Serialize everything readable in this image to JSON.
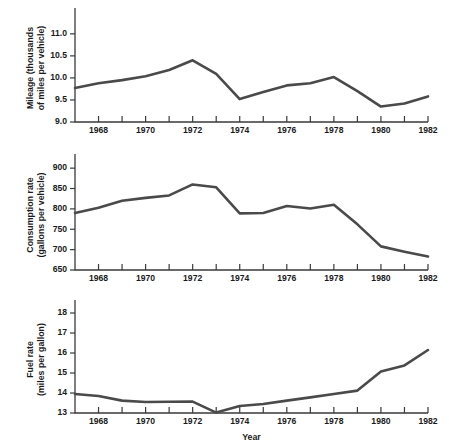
{
  "figure": {
    "xlabel": "Year",
    "line_color": "#4a4a4a",
    "axis_color": "#3a3a3a",
    "background": "#ffffff"
  },
  "chart_data": [
    {
      "type": "line",
      "title": "",
      "panel_index": 0,
      "ylabel": "Mileage (thousands of miles per vehicle)",
      "ylabel_line1": "Mileage (thousands",
      "ylabel_line2": "of miles per vehicle)",
      "xlabel": "",
      "grid": false,
      "legend": "none",
      "x": [
        1967,
        1968,
        1969,
        1970,
        1971,
        1972,
        1973,
        1974,
        1975,
        1976,
        1977,
        1978,
        1979,
        1980,
        1981,
        1982
      ],
      "values": [
        9.77,
        9.88,
        9.95,
        10.04,
        10.18,
        10.4,
        10.09,
        9.52,
        9.68,
        9.83,
        9.88,
        10.02,
        9.7,
        9.35,
        9.42,
        9.58
      ],
      "xlim": [
        1967,
        1982
      ],
      "ylim": [
        9.0,
        11.45
      ],
      "yticks": [
        9.0,
        9.5,
        10.0,
        10.5,
        11.0
      ],
      "ytick_labels": [
        "9.0",
        "9.5",
        "10.0",
        "10.5",
        "11.0"
      ],
      "xticks": [
        1967,
        1968,
        1969,
        1970,
        1971,
        1972,
        1973,
        1974,
        1975,
        1976,
        1977,
        1978,
        1979,
        1980,
        1981,
        1982
      ],
      "xtick_labels": [
        "",
        "1968",
        "",
        "1970",
        "",
        "1972",
        "",
        "1974",
        "",
        "1976",
        "",
        "1978",
        "",
        "1980",
        "",
        "1982"
      ]
    },
    {
      "type": "line",
      "title": "",
      "panel_index": 1,
      "ylabel": "Consumption rate (gallons per vehicle)",
      "ylabel_line1": "Consumption rate",
      "ylabel_line2": "(gallons per vehicle)",
      "xlabel": "",
      "grid": false,
      "legend": "none",
      "x": [
        1967,
        1968,
        1969,
        1970,
        1971,
        1972,
        1973,
        1974,
        1975,
        1976,
        1977,
        1978,
        1979,
        1980,
        1981,
        1982
      ],
      "values": [
        790,
        803,
        820,
        827,
        833,
        860,
        853,
        789,
        790,
        807,
        801,
        810,
        762,
        708,
        695,
        683
      ],
      "xlim": [
        1967,
        1982
      ],
      "ylim": [
        650,
        920
      ],
      "yticks": [
        650,
        700,
        750,
        800,
        850,
        900
      ],
      "ytick_labels": [
        "650",
        "700",
        "750",
        "800",
        "850",
        "900"
      ],
      "xticks": [
        1967,
        1968,
        1969,
        1970,
        1971,
        1972,
        1973,
        1974,
        1975,
        1976,
        1977,
        1978,
        1979,
        1980,
        1981,
        1982
      ],
      "xtick_labels": [
        "",
        "1968",
        "",
        "1970",
        "",
        "1972",
        "",
        "1974",
        "",
        "1976",
        "",
        "1978",
        "",
        "1980",
        "",
        "1982"
      ]
    },
    {
      "type": "line",
      "title": "",
      "panel_index": 2,
      "ylabel": "Fuel rate (miles per gallon)",
      "ylabel_line1": "Fuel rate",
      "ylabel_line2": "(miles per gallon)",
      "xlabel": "Year",
      "grid": false,
      "legend": "none",
      "x": [
        1967,
        1968,
        1969,
        1970,
        1971,
        1972,
        1973,
        1974,
        1975,
        1976,
        1977,
        1978,
        1979,
        1980,
        1981,
        1982
      ],
      "values": [
        13.95,
        13.85,
        13.62,
        13.55,
        13.56,
        13.57,
        13.02,
        13.35,
        13.45,
        13.62,
        13.78,
        13.95,
        14.12,
        15.08,
        15.38,
        16.15
      ],
      "xlim": [
        1967,
        1982
      ],
      "ylim": [
        13.0,
        18.35
      ],
      "yticks": [
        13,
        14,
        15,
        16,
        17,
        18
      ],
      "ytick_labels": [
        "13",
        "14",
        "15",
        "16",
        "17",
        "18"
      ],
      "xticks": [
        1967,
        1968,
        1969,
        1970,
        1971,
        1972,
        1973,
        1974,
        1975,
        1976,
        1977,
        1978,
        1979,
        1980,
        1981,
        1982
      ],
      "xtick_labels": [
        "",
        "1968",
        "",
        "1970",
        "",
        "1972",
        "",
        "1974",
        "",
        "1976",
        "",
        "1978",
        "",
        "1980",
        "",
        "1982"
      ]
    }
  ]
}
